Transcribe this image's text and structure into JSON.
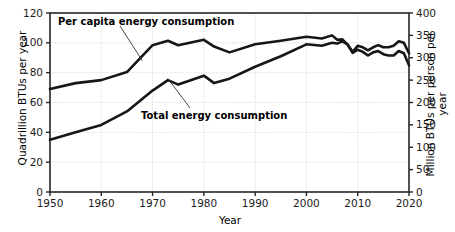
{
  "chart_data": {
    "type": "line",
    "title": "",
    "xlabel": "Year",
    "ylabel": "Quadrillion BTUs per year",
    "ylabel_right": "Million BTUs per person per year",
    "xlim": [
      1950,
      2020
    ],
    "ylim": [
      0,
      120
    ],
    "ylim_right": [
      0,
      400
    ],
    "grid": true,
    "grid_style": "dotted",
    "legend_position": "inline-annotations",
    "xticks": [
      "1950",
      "1960",
      "1970",
      "1980",
      "1990",
      "2000",
      "2010",
      "2020"
    ],
    "xtick_values": [
      1950,
      1960,
      1970,
      1980,
      1990,
      2000,
      2010,
      2020
    ],
    "yticks": [
      "0",
      "20",
      "40",
      "60",
      "80",
      "100",
      "120"
    ],
    "ytick_values": [
      0,
      20,
      40,
      60,
      80,
      100,
      120
    ],
    "yticks_right": [
      "0",
      "50",
      "100",
      "150",
      "200",
      "250",
      "300",
      "350",
      "400"
    ],
    "ytick_values_right": [
      0,
      50,
      100,
      150,
      200,
      250,
      300,
      350,
      400
    ],
    "series": [
      {
        "name": "Per capita energy consumption",
        "axis": "right",
        "units": "Million BTUs per person per year",
        "x": [
          1950,
          1955,
          1960,
          1965,
          1970,
          1973,
          1975,
          1980,
          1982,
          1985,
          1990,
          1995,
          2000,
          2003,
          2005,
          2006,
          2007,
          2008,
          2009,
          2010,
          2011,
          2012,
          2013,
          2014,
          2015,
          2016,
          2017,
          2018,
          2019,
          2020
        ],
        "values": [
          230,
          243,
          250,
          268,
          328,
          338,
          328,
          340,
          325,
          312,
          330,
          338,
          347,
          343,
          350,
          340,
          341,
          330,
          311,
          318,
          313,
          305,
          312,
          315,
          308,
          305,
          305,
          315,
          310,
          283
        ],
        "values_left_scale": [
          69,
          73,
          75,
          80.4,
          98.4,
          101.4,
          98.4,
          102,
          97.5,
          93.6,
          99,
          101.4,
          104.1,
          102.9,
          105,
          102,
          102.3,
          99,
          93.3,
          95.4,
          93.9,
          91.5,
          93.6,
          94.5,
          92.4,
          91.5,
          91.5,
          94.5,
          93,
          84.9
        ]
      },
      {
        "name": "Total energy consumption",
        "axis": "left",
        "units": "Quadrillion BTUs per year",
        "x": [
          1950,
          1955,
          1960,
          1965,
          1970,
          1973,
          1975,
          1980,
          1982,
          1985,
          1990,
          1995,
          2000,
          2003,
          2005,
          2006,
          2007,
          2008,
          2009,
          2010,
          2011,
          2012,
          2013,
          2014,
          2015,
          2016,
          2017,
          2018,
          2019,
          2020
        ],
        "values": [
          35,
          40,
          45,
          54,
          68,
          75,
          72,
          78,
          73,
          76,
          84,
          91,
          99,
          98,
          100,
          99.5,
          101,
          99,
          94,
          98,
          97,
          95,
          97,
          98.5,
          97,
          97,
          98,
          101,
          100,
          93
        ]
      }
    ],
    "annotations": [
      {
        "text": "Per capita energy consumption",
        "target_year": 1968,
        "target_value_left": 88
      },
      {
        "text": "Total energy consumption",
        "target_year": 1973,
        "target_value_left": 76
      }
    ]
  }
}
